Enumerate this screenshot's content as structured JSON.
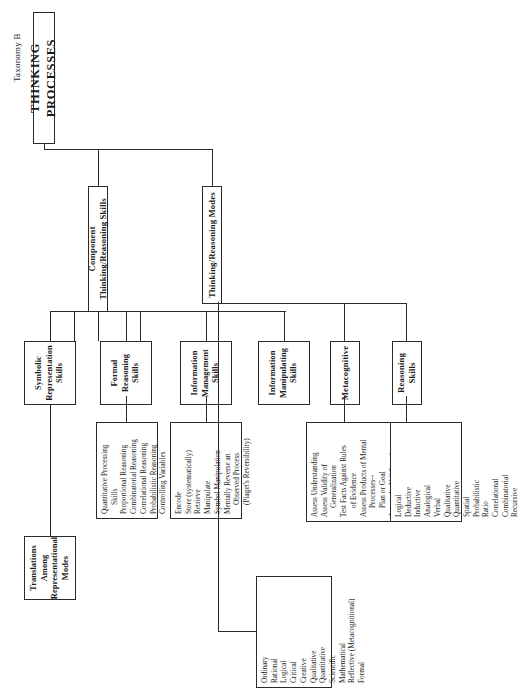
{
  "page": {
    "taxonomy_label": "Taxonomy B",
    "title": "THINKING PROCESSES"
  },
  "branches": {
    "modes": "Thinking/Reasoning Modes",
    "component": "Component Thinking/Reasoning Skills"
  },
  "nodes": {
    "reasoning_skills": "Reasoning Skills",
    "metacognitive": "Metacognitive",
    "information_manipulating": "Information\nManipulating\nSkills",
    "information_management": "Information\nManagement\nSkills",
    "formal_reasoning": "Formal\nReasoning\nSkills",
    "symbolic_representation": "Symbolic\nRepresentation\nSkills",
    "translations": "Translations Among\nRepresentational\nModes"
  },
  "node_lines": {
    "information_manipulating": [
      "Information",
      "Manipulating",
      "Skills"
    ],
    "information_management": [
      "Information",
      "Management",
      "Skills"
    ],
    "formal_reasoning": [
      "Formal",
      "Reasoning",
      "Skills"
    ],
    "symbolic_representation": [
      "Symbolic",
      "Representation",
      "Skills"
    ],
    "translations": [
      "Translations Among",
      "Representational",
      "Modes"
    ]
  },
  "lists": {
    "modes": [
      "Ordinary",
      "Rational",
      "Logical",
      "Critical",
      "Creative",
      "Qualitative",
      "Quantitative",
      "Scientific",
      "Mathematical",
      "Reflective (Metacognitional)",
      "Formal"
    ],
    "reasoning_skills": [
      "Logical",
      "Deductive",
      "Inductive",
      "Analogical",
      "Verbal",
      "Qualitative",
      "Quantitative",
      "Spatial",
      "Probabilistic",
      "Ratio",
      "Correlational",
      "Combinatorial",
      "Recursive"
    ],
    "metacognitive": [
      {
        "text": "Assess Understanding",
        "indent": false
      },
      {
        "text": "Assess Validity of",
        "indent": false
      },
      {
        "text": "Generalization",
        "indent": true
      },
      {
        "text": "Test Facts Against Rules",
        "indent": false
      },
      {
        "text": "of Evidence",
        "indent": true
      },
      {
        "text": "Assess Products of Mental",
        "indent": false
      },
      {
        "text": "Processes--",
        "indent": true
      },
      {
        "text": "Plan or Goal",
        "indent": true
      },
      {
        "text": "Assess the Validity of",
        "indent": false
      },
      {
        "text": "a Mental Process--",
        "indent": true
      },
      {
        "text": "Proportional Reasoning",
        "indent": true
      }
    ],
    "information_management": [
      {
        "text": "Encode",
        "indent": false
      },
      {
        "text": "Store (systematically)",
        "indent": false
      },
      {
        "text": "Retrieve",
        "indent": false
      },
      {
        "text": "Manipulate",
        "indent": false
      },
      {
        "text": "Symbol Manipulation",
        "indent": false
      },
      {
        "text": "Mentally Reverse an",
        "indent": false
      },
      {
        "text": "Observed Process",
        "indent": true
      },
      {
        "text": "(Piaget's Reversibility)",
        "indent": true
      }
    ],
    "formal_reasoning": [
      {
        "text": "Quantitative  Processing",
        "indent": false
      },
      {
        "text": "Skills",
        "indent": true
      },
      {
        "text": "Proportional Reasoning",
        "indent": false
      },
      {
        "text": "Combinatorial Reasoning",
        "indent": false
      },
      {
        "text": "Correlational Reasoning",
        "indent": false
      },
      {
        "text": "Probabilistic Reasoning",
        "indent": false
      },
      {
        "text": "Controlling Variables",
        "indent": false
      }
    ]
  },
  "colors": {
    "ink": "#1b1b1b",
    "rule": "#2a2a2a",
    "paper": "#ffffff"
  }
}
